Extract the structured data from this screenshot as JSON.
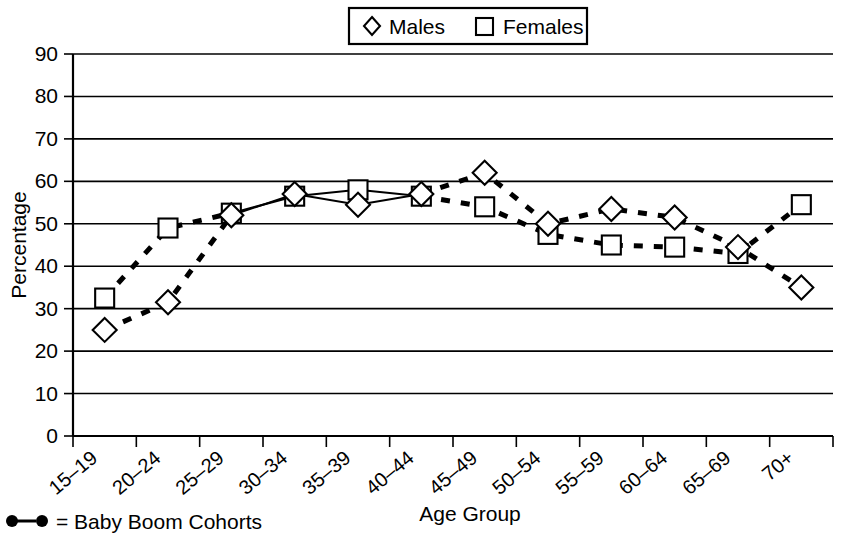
{
  "chart_data": {
    "type": "line",
    "title": "",
    "xlabel": "Age Group",
    "ylabel": "Percentage",
    "ylim": [
      0,
      90
    ],
    "ytick_step": 10,
    "yticks": [
      "0",
      "10",
      "20",
      "30",
      "40",
      "50",
      "60",
      "70",
      "80",
      "90"
    ],
    "grid": true,
    "legend_position": "top-center",
    "categories": [
      "15–19",
      "20–24",
      "25–29",
      "30–34",
      "35–39",
      "40–44",
      "45–49",
      "50–54",
      "55–59",
      "60–64",
      "65–69",
      "70+"
    ],
    "series": [
      {
        "name": "Males",
        "marker": "diamond",
        "values": [
          25,
          31.5,
          52,
          57,
          54.5,
          57,
          62,
          50,
          53.5,
          51.5,
          44.5,
          35
        ]
      },
      {
        "name": "Females",
        "marker": "square",
        "values": [
          32.5,
          49,
          52.5,
          56.5,
          58,
          56.5,
          54,
          47.5,
          45,
          44.5,
          43,
          54.5
        ]
      }
    ],
    "solid_segment_categories": [
      "25–29",
      "30–34",
      "35–39",
      "40–44"
    ],
    "dashed_segment_note": "Baby Boom Cohorts shown with heavy dashed line"
  },
  "legend": {
    "entries": [
      {
        "label": "Males",
        "marker": "diamond"
      },
      {
        "label": "Females",
        "marker": "square"
      }
    ]
  },
  "footnote": {
    "symbol": "●—●",
    "text": "= Baby Boom Cohorts"
  },
  "colors": {
    "ink": "#000000",
    "background": "#ffffff",
    "marker_fill": "#ffffff"
  }
}
